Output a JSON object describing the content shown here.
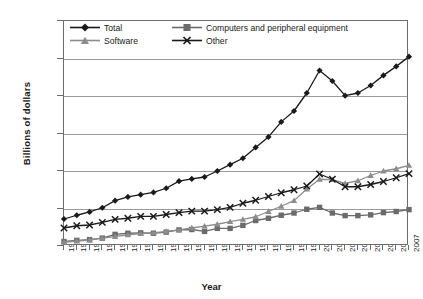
{
  "chart_data": {
    "type": "line",
    "title": "",
    "xlabel": "Year",
    "ylabel": "Billions of dollars",
    "grid": true,
    "legend_position": "top-left-inside",
    "xlim": [
      1980,
      2007
    ],
    "ylim": [
      0,
      600
    ],
    "ytick_step": 100,
    "yticks": [
      0,
      100,
      200,
      300,
      400,
      500,
      600
    ],
    "categories": [
      1980,
      1981,
      1982,
      1983,
      1984,
      1985,
      1986,
      1987,
      1988,
      1989,
      1990,
      1991,
      1992,
      1993,
      1994,
      1995,
      1996,
      1997,
      1998,
      1999,
      2000,
      2001,
      2002,
      2003,
      2004,
      2005,
      2006,
      2007
    ],
    "xtick_labels": [
      "1980",
      "1981",
      "1982",
      "1983",
      "1984",
      "1985",
      "1986",
      "1987",
      "1988",
      "1989",
      "1990",
      "1991",
      "1992",
      "1993",
      "1994",
      "1995",
      "1996",
      "1997",
      "1998",
      "1999",
      "2000",
      "2001",
      "2002",
      "2003",
      "2004",
      "2005",
      "2006",
      "2007"
    ],
    "series": [
      {
        "name": "Total",
        "color": "#1a1a1a",
        "marker": "diamond",
        "values": [
          72,
          82,
          91,
          102,
          121,
          131,
          137,
          143,
          154,
          173,
          179,
          184,
          200,
          217,
          234,
          263,
          291,
          331,
          360,
          408,
          468,
          440,
          401,
          408,
          428,
          455,
          479,
          505
        ]
      },
      {
        "name": "Computers and peripheral equipment",
        "color": "#6b6b6b",
        "marker": "square",
        "values": [
          12,
          15,
          17,
          21,
          31,
          34,
          35,
          34,
          37,
          43,
          44,
          39,
          47,
          47,
          55,
          68,
          74,
          82,
          88,
          98,
          103,
          88,
          81,
          81,
          83,
          89,
          92,
          97
        ]
      },
      {
        "name": "Software",
        "color": "#8c8c8c",
        "marker": "triangle",
        "values": [
          10,
          13,
          16,
          21,
          25,
          30,
          33,
          35,
          39,
          43,
          48,
          53,
          58,
          65,
          71,
          78,
          92,
          106,
          121,
          152,
          178,
          177,
          167,
          174,
          188,
          200,
          206,
          215
        ]
      },
      {
        "name": "Other",
        "color": "#1a1a1a",
        "marker": "x",
        "values": [
          48,
          54,
          56,
          63,
          71,
          74,
          79,
          79,
          84,
          89,
          93,
          93,
          97,
          103,
          114,
          122,
          132,
          142,
          150,
          160,
          192,
          178,
          158,
          158,
          164,
          172,
          182,
          193
        ]
      }
    ]
  },
  "axes": {
    "ylabel": "Billions of dollars",
    "xlabel": "Year"
  },
  "legend": {
    "entries": [
      {
        "label": "Total"
      },
      {
        "label": "Computers and peripheral equipment"
      },
      {
        "label": "Software"
      },
      {
        "label": "Other"
      }
    ]
  }
}
